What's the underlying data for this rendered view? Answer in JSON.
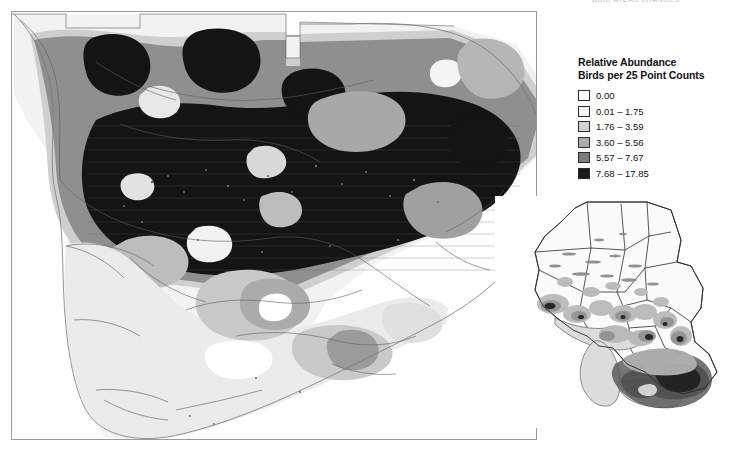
{
  "running_head": "BIRD ATLAS CHANGES",
  "legend": {
    "title_line1": "Relative Abundance",
    "title_line2": "Birds per 25 Point Counts",
    "classes": [
      {
        "label": "0.00",
        "color": "#ffffff",
        "min": 0,
        "max": 0
      },
      {
        "label": "0.01 – 1.75",
        "color": "#f4f4f4",
        "min": 0.01,
        "max": 1.75
      },
      {
        "label": "1.76 – 3.59",
        "color": "#d2d2d2",
        "min": 1.76,
        "max": 3.59
      },
      {
        "label": "3.60 – 5.56",
        "color": "#ababab",
        "min": 3.6,
        "max": 5.56
      },
      {
        "label": "5.57 – 7.67",
        "color": "#7d7d7d",
        "min": 5.57,
        "max": 7.67
      },
      {
        "label": "7.68 – 17.85",
        "color": "#1a1a1a",
        "min": 7.68,
        "max": 17.85
      }
    ]
  },
  "main_map": {
    "name": "southern-ontario-relative-abundance-map",
    "frame_color": "#9a9a9a",
    "water_color": "#ffffff",
    "outline_color": "#6e6e6e"
  },
  "inset_map": {
    "name": "province-of-ontario-overview-inset",
    "outline_color": "#2d2d2d",
    "water_color": "#d8d8d8"
  },
  "chart_data": {
    "type": "map",
    "title": "Relative Abundance",
    "subtitle": "Birds per 25 Point Counts",
    "unit": "birds per 25 point counts",
    "classification": "graduated / contoured abundance surface",
    "class_breaks": [
      0,
      0.01,
      1.76,
      3.6,
      5.57,
      7.68,
      17.85
    ],
    "class_labels": [
      "0.00",
      "0.01 – 1.75",
      "1.76 – 3.59",
      "3.60 – 5.56",
      "5.57 – 7.67",
      "7.68 – 17.85"
    ],
    "class_colors": [
      "#ffffff",
      "#f4f4f4",
      "#d2d2d2",
      "#ababab",
      "#7d7d7d",
      "#1a1a1a"
    ],
    "legend_position": "top-right",
    "panels": [
      "main detail map (southern/central Ontario)",
      "inset locator map (full province of Ontario)"
    ]
  }
}
